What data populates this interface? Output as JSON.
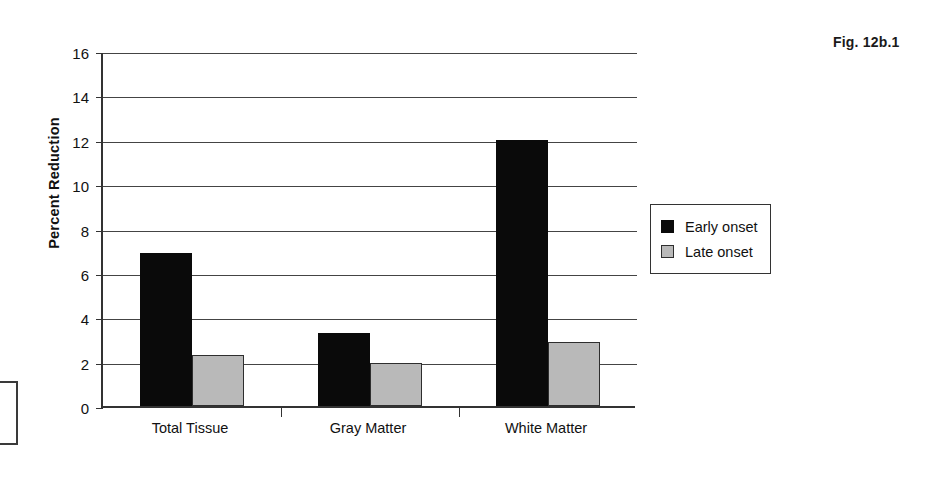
{
  "figure": {
    "label": "Fig. 12b.1"
  },
  "chart_data": {
    "type": "bar",
    "title": "",
    "xlabel": "",
    "ylabel": "Percent Reduction",
    "categories": [
      "Total Tissue",
      "Gray Matter",
      "White Matter"
    ],
    "series": [
      {
        "name": "Early onset",
        "color": "#0a0a0a",
        "values": [
          6.9,
          3.3,
          12.0
        ]
      },
      {
        "name": "Late onset",
        "color": "#b9b9b9",
        "values": [
          2.3,
          1.95,
          2.9
        ]
      }
    ],
    "ylim": [
      0,
      16
    ],
    "yticks": [
      0,
      2,
      4,
      6,
      8,
      10,
      12,
      14,
      16
    ],
    "ytick_labels": [
      "0",
      "2",
      "4",
      "6",
      "8",
      "10",
      "12",
      "14",
      "16"
    ],
    "grid": true,
    "legend_position": "right"
  },
  "legend": {
    "items": [
      {
        "label": "Early onset",
        "swatch": "black-square-icon"
      },
      {
        "label": "Late onset",
        "swatch": "gray-square-icon"
      }
    ]
  }
}
